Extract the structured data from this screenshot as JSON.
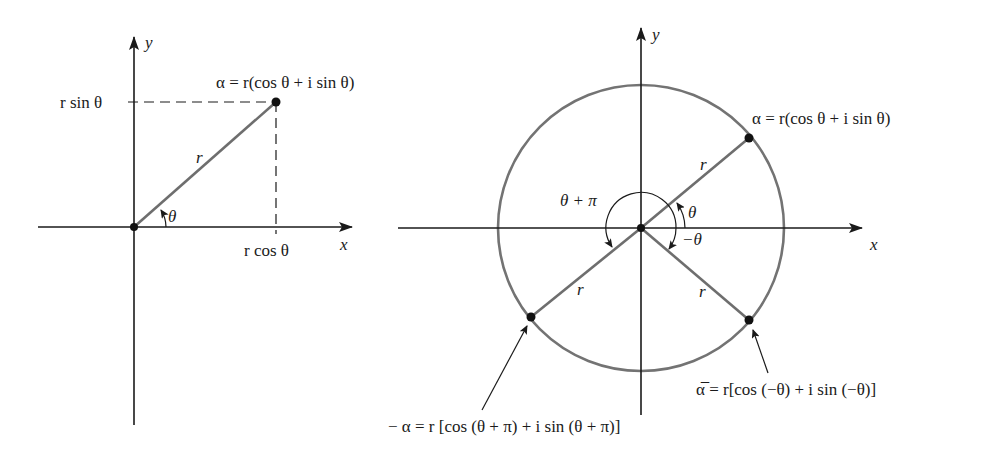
{
  "figure": {
    "left_panel": {
      "axis_x_label": "x",
      "axis_y_label": "y",
      "point_label": "α = r(cos θ + i sin θ)",
      "y_projection_label": "r sin θ",
      "x_projection_label": "r cos θ",
      "radius_label": "r",
      "angle_label": "θ"
    },
    "right_panel": {
      "axis_x_label": "x",
      "axis_y_label": "y",
      "alpha_label": "α = r(cos θ + i sin θ)",
      "neg_alpha_label": "− α = r [cos (θ + π) + i sin (θ + π)]",
      "conj_alpha_label": "α̅ = r[cos (−θ) + i sin (−θ)]",
      "radius_labels": [
        "r",
        "r",
        "r"
      ],
      "angle_theta_label": "θ",
      "angle_neg_theta_label": "−θ",
      "angle_theta_plus_pi_label": "θ + π"
    },
    "colors": {
      "axis": "#1a1a1a",
      "radius_line": "#6e6e6e",
      "circle": "#737373",
      "point": "#111111",
      "background": "#ffffff"
    }
  }
}
